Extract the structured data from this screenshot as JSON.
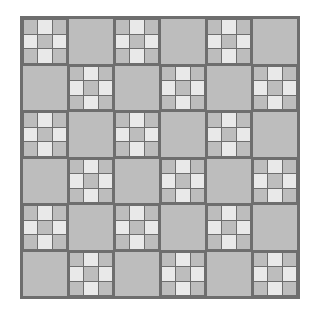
{
  "figure": {
    "background_color": "#ffffff",
    "board": {
      "left_px": 20,
      "top_px": 16,
      "width_px": 280,
      "height_px": 283,
      "border_color": "#6e6e6e",
      "border_width_px": 2
    }
  },
  "chart_data": {
    "type": "heatmap",
    "subtitle": "",
    "xlabel": "",
    "ylabel": "",
    "grid": true,
    "legend_position": "none",
    "rows": 6,
    "cols": 6,
    "cell_size_px": 46.5,
    "palette": {
      "mid_gray": "#bdbdbd",
      "light_gray": "#e9e9e9",
      "line_gray": "#6e6e6e",
      "background": "#ffffff"
    },
    "tile_rule": "tile is subdivided when (row + col) is even, otherwise plain",
    "subtile_rule": "within a subdivided tile the 3x3 sub-squares alternate: corners and center are mid_gray, the four edge midpoints are light_gray",
    "subtile_pattern": [
      [
        "dark",
        "light",
        "dark"
      ],
      [
        "light",
        "dark",
        "light"
      ],
      [
        "dark",
        "light",
        "dark"
      ]
    ],
    "categories": [
      "c1",
      "c2",
      "c3",
      "c4",
      "c5",
      "c6"
    ],
    "row_labels": [
      "r1",
      "r2",
      "r3",
      "r4",
      "r5",
      "r6"
    ],
    "values": [
      [
        1,
        0,
        1,
        0,
        1,
        0
      ],
      [
        0,
        1,
        0,
        1,
        0,
        1
      ],
      [
        1,
        0,
        1,
        0,
        1,
        0
      ],
      [
        0,
        1,
        0,
        1,
        0,
        1
      ],
      [
        1,
        0,
        1,
        0,
        1,
        0
      ],
      [
        0,
        1,
        0,
        1,
        0,
        1
      ]
    ],
    "value_legend": {
      "1": "subdivided 3x3 tile",
      "0": "plain solid tile"
    },
    "counts": {
      "subdivided_tiles": 18,
      "plain_tiles": 18,
      "total_tiles": 36,
      "sub_squares_per_subdivided_tile": 9,
      "total_sub_squares": 162
    }
  }
}
